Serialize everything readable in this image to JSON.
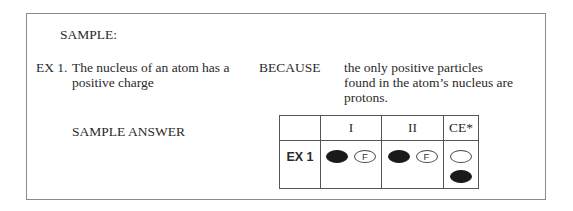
{
  "sample": {
    "title": "SAMPLE:",
    "example_label": "EX 1.",
    "statement": [
      "The nucleus of an atom has a",
      "positive charge"
    ],
    "connector": "BECAUSE",
    "reason": [
      "the only positive particles",
      "found in the atom’s nucleus are",
      "protons."
    ],
    "answer_label": "SAMPLE ANSWER"
  },
  "answer_grid": {
    "headers": [
      "",
      "I",
      "II",
      "CE*"
    ],
    "rows": [
      {
        "label": "EX 1",
        "statement_I": {
          "true_bubble": "filled",
          "false_bubble_label": "F"
        },
        "statement_II": {
          "true_bubble": "filled",
          "false_bubble_label": "F"
        },
        "ce": {
          "top_bubble": "empty",
          "bottom_bubble": "filled"
        }
      }
    ]
  }
}
